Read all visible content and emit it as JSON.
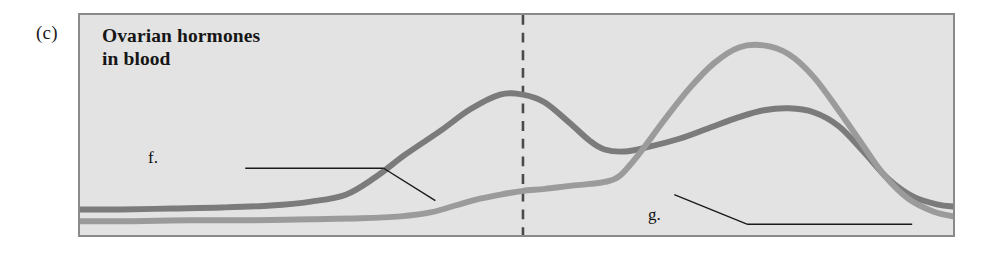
{
  "figure": {
    "panel_letter": "(c)",
    "title": "Ovarian hormones\nin blood",
    "background_color": "#e3e3e3",
    "border_color": "#8a8a8a",
    "page_background": "#ffffff"
  },
  "annotations": {
    "f": {
      "label": "f.",
      "leader_color": "#1a1a1a"
    },
    "g": {
      "label": "g.",
      "leader_color": "#1a1a1a"
    }
  },
  "chart_data": {
    "type": "line",
    "title": "Ovarian hormones in blood",
    "xlabel": "",
    "ylabel": "",
    "grid": false,
    "legend": "none",
    "axis_ticks": "none",
    "xlim": [
      0,
      877
    ],
    "ylim": [
      0,
      224
    ],
    "annotations": [
      {
        "key": "f",
        "label": "f.",
        "points_to_series": "curve-f-dark",
        "label_pos": [
          151,
          157
        ],
        "leader_horizontal": [
          [
            166,
            156
          ],
          [
            305,
            156
          ]
        ],
        "leader_diagonal": [
          [
            305,
            156
          ],
          [
            357,
            189
          ]
        ]
      },
      {
        "key": "g",
        "label": "g.",
        "points_to_series": "curve-g-light",
        "label_pos": [
          651,
          214
        ],
        "leader_horizontal": [
          [
            670,
            213
          ],
          [
            836,
            213
          ]
        ],
        "leader_diagonal": [
          [
            670,
            213
          ],
          [
            597,
            183
          ]
        ]
      }
    ],
    "markers": [
      {
        "name": "ovulation-dashed-line",
        "type": "vertical-dashed",
        "x": 523,
        "color": "#4a4a4a",
        "dash": "10,8"
      }
    ],
    "series": [
      {
        "name": "curve-f-dark",
        "label": "f.",
        "color": "#7b7b7b",
        "width": 6,
        "x": [
          78,
          120,
          170,
          220,
          270,
          310,
          345,
          375,
          405,
          440,
          470,
          500,
          523,
          545,
          570,
          590,
          605,
          625,
          650,
          680,
          710,
          740,
          765,
          790,
          815,
          840,
          865,
          890,
          915,
          940,
          955
        ],
        "y_pixel": [
          211,
          211,
          210,
          209,
          207,
          203,
          196,
          178,
          155,
          131,
          109,
          94,
          94,
          102,
          123,
          141,
          150,
          152,
          147,
          139,
          128,
          117,
          110,
          108,
          112,
          126,
          152,
          180,
          198,
          206,
          208
        ]
      },
      {
        "name": "curve-g-light",
        "label": "g.",
        "color": "#9b9b9b",
        "width": 6,
        "x": [
          78,
          130,
          190,
          250,
          310,
          360,
          400,
          430,
          455,
          480,
          505,
          523,
          545,
          570,
          590,
          605,
          620,
          640,
          665,
          690,
          715,
          740,
          765,
          790,
          815,
          840,
          862,
          885,
          910,
          935,
          955
        ],
        "y_pixel": [
          223,
          223,
          222,
          222,
          221,
          220,
          218,
          214,
          207,
          200,
          195,
          192,
          190,
          187,
          185,
          183,
          177,
          154,
          120,
          88,
          62,
          46,
          44,
          53,
          76,
          110,
          142,
          175,
          200,
          213,
          218
        ]
      }
    ]
  }
}
